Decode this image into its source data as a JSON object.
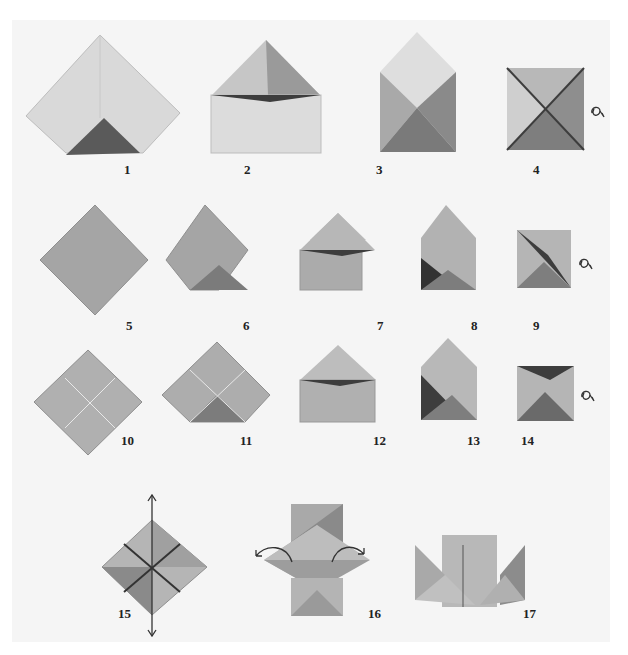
{
  "figure": {
    "colors": {
      "background": "#f5f5f5",
      "paper_light": "#d8d8d8",
      "paper_mid": "#b4b4b4",
      "paper_dark": "#7d7d7d",
      "shadow": "#3d3d3d"
    },
    "steps": [
      {
        "label": "1"
      },
      {
        "label": "2"
      },
      {
        "label": "3"
      },
      {
        "label": "4"
      },
      {
        "label": "5"
      },
      {
        "label": "6"
      },
      {
        "label": "7"
      },
      {
        "label": "8"
      },
      {
        "label": "9"
      },
      {
        "label": "10"
      },
      {
        "label": "11"
      },
      {
        "label": "12"
      },
      {
        "label": "13"
      },
      {
        "label": "14"
      },
      {
        "label": "15"
      },
      {
        "label": "16"
      },
      {
        "label": "17"
      }
    ],
    "annotations": {
      "step4": "turn-over-arrow-icon",
      "step9": "turn-over-arrow-icon",
      "step14": "turn-over-arrow-icon",
      "step15": "pull-apart-arrows-icon",
      "step16": "open-out-arrows-icon"
    }
  }
}
